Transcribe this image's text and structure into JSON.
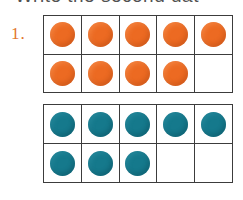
{
  "page": {
    "width": 243,
    "height": 200,
    "background": "#ffffff"
  },
  "instruction": {
    "text": "Write the second dat",
    "note": "partially cut off at top edge of page"
  },
  "item": {
    "number_label": "1."
  },
  "colors": {
    "orange_counter": "#ec6a22",
    "teal_counter": "#15798c",
    "frame_border": "#3c3c3c",
    "item_number": "#e2762c",
    "text": "#2b2b2b"
  },
  "ten_frames": [
    {
      "name": "orange-ten-frame",
      "color": "orange",
      "columns": 5,
      "rows": 2,
      "filled_count": 9,
      "capacity": 10,
      "cells": [
        [
          true,
          true,
          true,
          true,
          true
        ],
        [
          true,
          true,
          true,
          true,
          false
        ]
      ]
    },
    {
      "name": "teal-ten-frame",
      "color": "teal",
      "columns": 5,
      "rows": 2,
      "filled_count": 8,
      "capacity": 10,
      "cells": [
        [
          true,
          true,
          true,
          true,
          true
        ],
        [
          true,
          true,
          true,
          false,
          false
        ]
      ]
    }
  ]
}
